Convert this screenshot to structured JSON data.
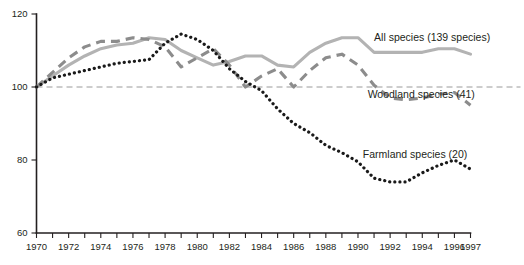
{
  "chart_data": {
    "type": "line",
    "title": "",
    "subtitle": "",
    "xlabel": "",
    "ylabel": "",
    "xlim": [
      1970,
      1997
    ],
    "ylim": [
      60,
      120
    ],
    "grid": false,
    "legend_position": "inline-right",
    "annotations": [
      {
        "text": "All species (139 species)",
        "series": "All species",
        "x": 1991.0,
        "y": 112.5
      },
      {
        "text": "Woodland species (41)",
        "series": "Woodland species",
        "x": 1990.6,
        "y": 97.0
      },
      {
        "text": "Farmland species (20)",
        "series": "Farmland species",
        "x": 1990.3,
        "y": 80.5
      }
    ],
    "reference_line": {
      "value": 100,
      "style": "dashed",
      "color": "#9a9a9a"
    },
    "y_ticks": [
      60,
      80,
      100,
      120
    ],
    "x_ticks": [
      1970,
      1971,
      1972,
      1973,
      1974,
      1975,
      1976,
      1977,
      1978,
      1979,
      1980,
      1981,
      1982,
      1983,
      1984,
      1985,
      1986,
      1987,
      1988,
      1989,
      1990,
      1991,
      1992,
      1993,
      1994,
      1995,
      1996,
      1997
    ],
    "x_tick_labels": [
      {
        "value": 1970,
        "label": "1970"
      },
      {
        "value": 1972,
        "label": "1972"
      },
      {
        "value": 1974,
        "label": "1974"
      },
      {
        "value": 1976,
        "label": "1976"
      },
      {
        "value": 1978,
        "label": "1978"
      },
      {
        "value": 1980,
        "label": "1980"
      },
      {
        "value": 1982,
        "label": "1982"
      },
      {
        "value": 1984,
        "label": "1984"
      },
      {
        "value": 1986,
        "label": "1986"
      },
      {
        "value": 1988,
        "label": "1988"
      },
      {
        "value": 1990,
        "label": "1990"
      },
      {
        "value": 1992,
        "label": "1992"
      },
      {
        "value": 1994,
        "label": "1994"
      },
      {
        "value": 1996,
        "label": "1996"
      },
      {
        "value": 1997,
        "label": "1997"
      }
    ],
    "y_tick_labels": [
      {
        "value": 120,
        "label": "120"
      },
      {
        "value": 100,
        "label": "100"
      },
      {
        "value": 80,
        "label": "80"
      },
      {
        "value": 60,
        "label": "60"
      }
    ],
    "x": [
      1970,
      1971,
      1972,
      1973,
      1974,
      1975,
      1976,
      1977,
      1978,
      1979,
      1980,
      1981,
      1982,
      1983,
      1984,
      1985,
      1986,
      1987,
      1988,
      1989,
      1990,
      1991,
      1992,
      1993,
      1994,
      1995,
      1996,
      1997
    ],
    "series": [
      {
        "name": "All species (139 species)",
        "short_name": "All species",
        "count": 139,
        "style": "solid",
        "color": "#b3b3b3",
        "values": [
          100,
          103,
          106,
          108.5,
          110.5,
          111.5,
          112,
          113.5,
          113,
          110,
          108,
          106,
          107,
          108.5,
          108.5,
          106,
          105.5,
          109.5,
          112,
          113.5,
          113.5,
          109.5,
          109.5,
          109.5,
          109.5,
          110.5,
          110.5,
          109
        ]
      },
      {
        "name": "Woodland species (41)",
        "short_name": "Woodland species",
        "count": 41,
        "style": "dashed",
        "color": "#8c8c8c",
        "values": [
          100,
          104,
          108,
          111,
          112.5,
          112.5,
          113.5,
          113,
          111,
          105.5,
          108,
          110.5,
          106,
          100,
          103,
          105,
          100,
          104.5,
          108,
          109,
          106,
          100.5,
          97,
          96.5,
          97,
          98,
          98.5,
          95
        ]
      },
      {
        "name": "Farmland species (20)",
        "short_name": "Farmland species",
        "count": 20,
        "style": "dotted",
        "color": "#1a1a1a",
        "values": [
          100,
          102.5,
          103.5,
          104.5,
          105.5,
          106.5,
          107,
          107.5,
          112,
          114.5,
          113,
          110,
          105,
          101.5,
          99,
          94,
          90,
          87.5,
          84,
          82,
          79.5,
          75,
          74,
          74,
          76.5,
          78.5,
          80,
          77.5
        ]
      }
    ]
  }
}
